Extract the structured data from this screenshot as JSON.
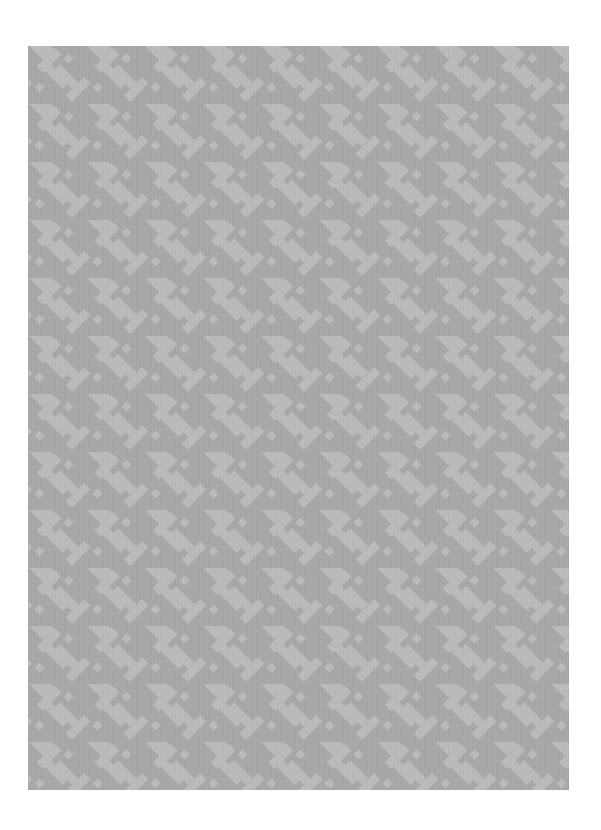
{
  "page": {
    "background": "#ffffff",
    "width": 601,
    "height": 830
  },
  "panel": {
    "description": "Grey patterned sample / swatch with diagonal basketweave motif",
    "x": 28,
    "y": 46,
    "width": 541,
    "height": 744,
    "pattern": {
      "name": "diagonal-basketweave",
      "ground_color": "#a9a9a9",
      "motif_color": "#bdbdbd",
      "tile_size": 58,
      "angle_deg": 45
    }
  }
}
